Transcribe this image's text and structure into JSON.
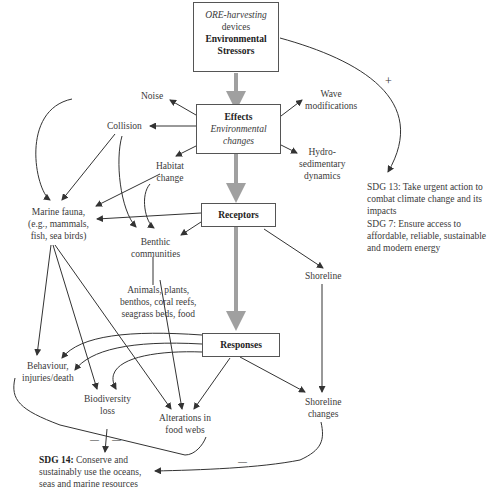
{
  "diagram": {
    "stressors_box": {
      "line1": "ORE-harvesting",
      "line2": "devices",
      "line3": "Environmental",
      "line4": "Stressors"
    },
    "effects_box": {
      "title": "Effects",
      "sub1": "Environmental",
      "sub2": "changes"
    },
    "receptors_box": {
      "title": "Receptors"
    },
    "responses_box": {
      "title": "Responses"
    },
    "effects": {
      "noise": "Noise",
      "collision": "Collision",
      "habitat_1": "Habitat",
      "habitat_2": "change",
      "wave_1": "Wave",
      "wave_2": "modifications",
      "hydro_1": "Hydro-",
      "hydro_2": "sedimentary",
      "hydro_3": "dynamics"
    },
    "receptors": {
      "marine_1": "Marine fauna,",
      "marine_2": "(e.g., mammals,",
      "marine_3": "fish, sea birds)",
      "benthic_1": "Benthic",
      "benthic_2": "communities",
      "animals_1": "Animals, plants,",
      "animals_2": "benthos, coral reefs,",
      "animals_3": "seagrass beds, food",
      "shoreline": "Shoreline"
    },
    "responses": {
      "behaviour_1": "Behaviour,",
      "behaviour_2": "injuries/death",
      "biodiversity_1": "Biodiversity",
      "biodiversity_2": "loss",
      "food_1": "Alterations in",
      "food_2": "food webs",
      "shore_1": "Shoreline",
      "shore_2": "changes"
    },
    "sdgs": {
      "sdg13": "SDG 13: Take urgent action to combat climate change and its impacts",
      "sdg7": "SDG 7: Ensure access to affordable, reliable, sustainable and modern energy",
      "sdg14_bold": "SDG 14:",
      "sdg14_text": " Conserve and sustainably use the oceans, seas and marine resources"
    },
    "signs": {
      "plus": "+",
      "minus": "—"
    },
    "colors": {
      "line": "#333333",
      "flow": "#a0a0a0",
      "box_border": "#555555"
    }
  }
}
